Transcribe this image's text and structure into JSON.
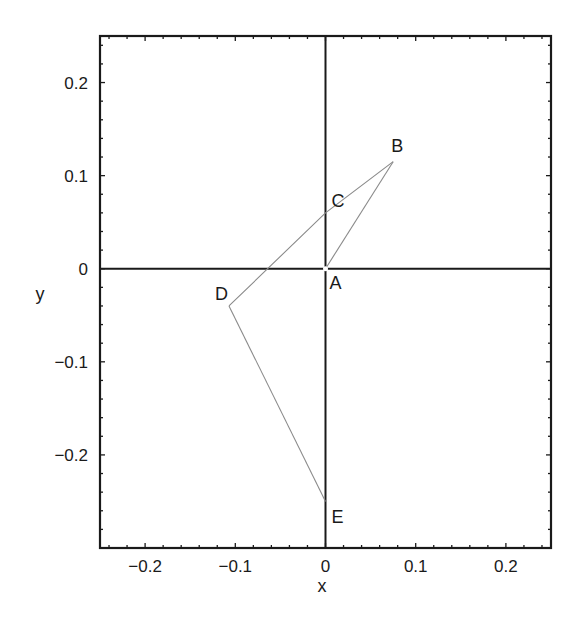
{
  "chart_data": {
    "type": "line",
    "title": "",
    "xlabel": "x",
    "ylabel": "y",
    "xlim": [
      -0.25,
      0.25
    ],
    "ylim": [
      -0.3,
      0.25
    ],
    "grid": false,
    "legend": null,
    "x_ticks": [
      -0.2,
      -0.1,
      0,
      0.1,
      0.2
    ],
    "x_tick_labels": [
      "−0.2",
      "−0.1",
      "0",
      "0.1",
      "0.2"
    ],
    "y_ticks": [
      -0.2,
      -0.1,
      0,
      0.1,
      0.2
    ],
    "y_tick_labels": [
      "−0.2",
      "−0.1",
      "0",
      "0.1",
      "0.2"
    ],
    "reference_lines": [
      {
        "name": "x-axis",
        "orientation": "horizontal",
        "value": 0
      },
      {
        "name": "y-axis",
        "orientation": "vertical",
        "value": 0
      }
    ],
    "points": [
      {
        "label": "A",
        "x": 0.0,
        "y": 0.0
      },
      {
        "label": "B",
        "x": 0.075,
        "y": 0.115
      },
      {
        "label": "C",
        "x": 0.0,
        "y": 0.06
      },
      {
        "label": "D",
        "x": -0.107,
        "y": -0.04
      },
      {
        "label": "E",
        "x": 0.0,
        "y": -0.25
      }
    ],
    "series": [
      {
        "name": "A-B",
        "x": [
          0.0,
          0.075
        ],
        "y": [
          0.0,
          0.115
        ]
      },
      {
        "name": "B-C-D",
        "x": [
          0.075,
          0.0,
          -0.107
        ],
        "y": [
          0.115,
          0.06,
          -0.04
        ]
      },
      {
        "name": "D-E",
        "x": [
          -0.107,
          0.0
        ],
        "y": [
          -0.04,
          -0.25
        ]
      }
    ]
  },
  "axes": {
    "xlabel": "x",
    "ylabel": "y"
  },
  "colors": {
    "frame": "#1a1a1a",
    "axis_lines": "#1a1a1a",
    "segments": "#8a8a8a",
    "background": "#ffffff"
  }
}
